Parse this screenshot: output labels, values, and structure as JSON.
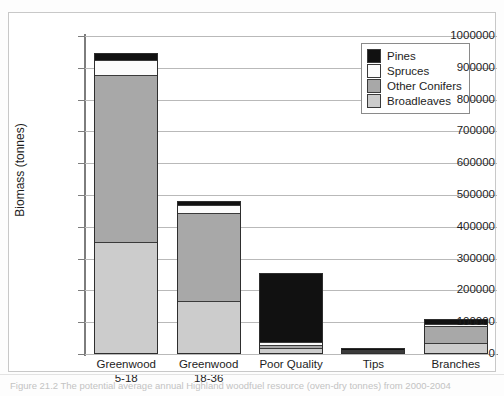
{
  "chart_data": {
    "type": "bar",
    "stacked": true,
    "title": "",
    "xlabel": "",
    "ylabel": "Biomass (tonnes)",
    "ylim": [
      0,
      1000000
    ],
    "ytick_interval": 100000,
    "ytick_labels": [
      "1000000",
      "900000",
      "800000",
      "700000",
      "600000",
      "500000",
      "400000",
      "300000",
      "200000",
      "100000",
      "0"
    ],
    "grid": true,
    "legend_position": "top-right",
    "categories": [
      "Greenwood 5-18",
      "Greenwood 18-36",
      "Poor Quality",
      "Tips",
      "Branches"
    ],
    "category_lines": [
      [
        "Greenwood",
        "5-18"
      ],
      [
        "Greenwood",
        "18-36"
      ],
      [
        "Poor Quality",
        ""
      ],
      [
        "Tips",
        ""
      ],
      [
        "Branches",
        ""
      ]
    ],
    "series": [
      {
        "name": "Broadleaves",
        "color": "#cccccc",
        "values": [
          350000,
          165000,
          15000,
          4000,
          30000
        ]
      },
      {
        "name": "Other Conifers",
        "color": "#a8a8a8",
        "values": [
          525000,
          275000,
          10000,
          3000,
          55000
        ]
      },
      {
        "name": "Spruces",
        "color": "#fcfcfc",
        "values": [
          47000,
          25000,
          10000,
          2000,
          5000
        ]
      },
      {
        "name": "Pines",
        "color": "#111111",
        "values": [
          18000,
          10000,
          215000,
          2000,
          15000
        ]
      }
    ],
    "stack_order_bottom_to_top": [
      "Broadleaves",
      "Other Conifers",
      "Spruces",
      "Pines"
    ],
    "bar_totals": [
      940000,
      475000,
      250000,
      11000,
      105000
    ]
  },
  "legend": {
    "entries": [
      {
        "label": "Pines",
        "color": "#111111"
      },
      {
        "label": "Spruces",
        "color": "#fcfcfc"
      },
      {
        "label": "Other Conifers",
        "color": "#a8a8a8"
      },
      {
        "label": "Broadleaves",
        "color": "#cccccc"
      }
    ]
  },
  "caption": {
    "text": "Figure 21.2  The potential average annual Highland woodfuel resource (oven-dry tonnes) from 2000-2004"
  }
}
